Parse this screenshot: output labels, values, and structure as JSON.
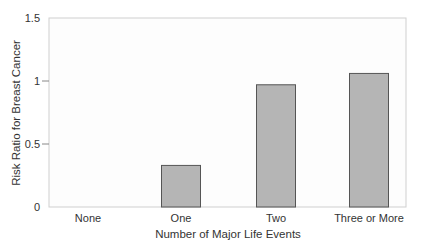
{
  "chart_data": {
    "type": "bar",
    "title": "",
    "xlabel": "Number of Major Life Events",
    "ylabel": "Risk Ratio for Breast Cancer",
    "categories": [
      "None",
      "One",
      "Two",
      "Three or More"
    ],
    "values": [
      0,
      0.33,
      0.97,
      1.06
    ],
    "ylim": [
      0,
      1.5
    ],
    "yticks": [
      0,
      0.5,
      1,
      1.5
    ],
    "ytick_labels": [
      "0",
      "0.5",
      "1",
      "1.5"
    ],
    "grid": false,
    "legend": null,
    "colors": {
      "bar_fill": "#b5b5b5",
      "bar_stroke": "#555555",
      "frame": "#cfcfcf",
      "axis": "#888888"
    }
  }
}
